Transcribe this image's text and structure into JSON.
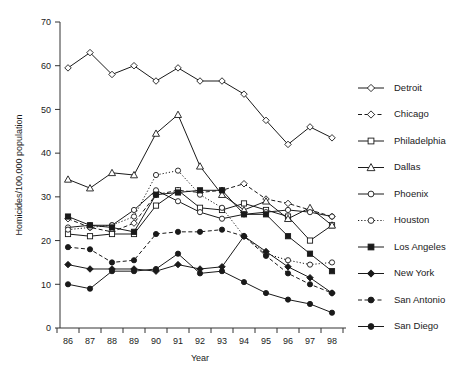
{
  "chart_data": {
    "type": "line",
    "title": "",
    "xlabel": "Year",
    "ylabel": "Homicides/100,000 population",
    "categories": [
      "86",
      "87",
      "88",
      "89",
      "90",
      "91",
      "92",
      "93",
      "94",
      "95",
      "96",
      "97",
      "98"
    ],
    "x_tick_labels": [
      "86",
      "87",
      "88",
      "89",
      "90",
      "91",
      "92",
      "93",
      "94",
      "95",
      "96",
      "97",
      "98"
    ],
    "y_tick_labels": [
      "0",
      "10",
      "20",
      "30",
      "40",
      "50",
      "60",
      "70"
    ],
    "y_ticks": [
      0,
      10,
      20,
      30,
      40,
      50,
      60,
      70
    ],
    "ylim": [
      0,
      70
    ],
    "grid": false,
    "legend_position": "right",
    "series": [
      {
        "name": "Detroit",
        "marker": "diamond-open",
        "linestyle": "solid",
        "values": [
          59.5,
          63.0,
          58.0,
          60.0,
          56.5,
          59.5,
          56.5,
          56.5,
          53.5,
          47.5,
          42.0,
          46.0,
          43.5
        ]
      },
      {
        "name": "Chicago",
        "marker": "diamond-open",
        "linestyle": "dashed",
        "values": [
          25.0,
          23.0,
          22.0,
          24.0,
          30.5,
          31.5,
          31.0,
          31.5,
          33.0,
          29.5,
          28.5,
          27.0,
          25.5
        ]
      },
      {
        "name": "Philadelphia",
        "marker": "square-open",
        "linestyle": "solid",
        "values": [
          21.5,
          21.0,
          21.5,
          21.5,
          28.0,
          31.5,
          27.5,
          27.0,
          28.5,
          27.0,
          25.5,
          20.0,
          23.5
        ]
      },
      {
        "name": "Dallas",
        "marker": "triangle-open",
        "linestyle": "solid",
        "values": [
          34.0,
          32.0,
          35.5,
          35.0,
          44.5,
          48.8,
          37.0,
          30.5,
          27.0,
          29.0,
          25.0,
          27.5,
          23.5
        ]
      },
      {
        "name": "Phoenix",
        "marker": "circle-open",
        "linestyle": "solid",
        "values": [
          23.0,
          23.5,
          23.5,
          27.0,
          31.5,
          29.0,
          26.5,
          25.0,
          26.0,
          26.5,
          27.0,
          26.5,
          25.5
        ]
      },
      {
        "name": "Houston",
        "marker": "circle-open",
        "linestyle": "dotted",
        "values": [
          22.5,
          23.0,
          23.5,
          25.5,
          35.0,
          36.0,
          30.5,
          27.5,
          21.0,
          17.0,
          15.5,
          14.5,
          15.0
        ]
      },
      {
        "name": "Los Angeles",
        "marker": "square-filled",
        "linestyle": "solid",
        "values": [
          25.5,
          23.5,
          23.0,
          22.0,
          30.5,
          31.0,
          31.5,
          31.5,
          26.0,
          26.0,
          21.0,
          17.0,
          13.0
        ]
      },
      {
        "name": "New York",
        "marker": "diamond-filled",
        "linestyle": "solid",
        "values": [
          14.5,
          13.5,
          13.5,
          13.5,
          13.0,
          14.5,
          13.5,
          14.0,
          21.0,
          17.5,
          14.0,
          11.5,
          8.0
        ]
      },
      {
        "name": "San Antonio",
        "marker": "circle-filled",
        "linestyle": "dashed",
        "values": [
          18.5,
          18.0,
          15.0,
          15.5,
          21.5,
          22.0,
          22.0,
          22.5,
          21.0,
          16.5,
          12.5,
          10.0,
          8.0
        ]
      },
      {
        "name": "San Diego",
        "marker": "circle-filled",
        "linestyle": "solid",
        "values": [
          10.0,
          9.0,
          13.0,
          13.0,
          13.5,
          17.0,
          12.5,
          13.0,
          10.5,
          8.0,
          6.5,
          5.5,
          3.5
        ]
      }
    ]
  },
  "legend": {
    "items": [
      {
        "label": "Detroit"
      },
      {
        "label": "Chicago"
      },
      {
        "label": "Philadelphia"
      },
      {
        "label": "Dallas"
      },
      {
        "label": "Phoenix"
      },
      {
        "label": "Houston"
      },
      {
        "label": "Los Angeles"
      },
      {
        "label": "New York"
      },
      {
        "label": "San Antonio"
      },
      {
        "label": "San Diego"
      }
    ]
  }
}
